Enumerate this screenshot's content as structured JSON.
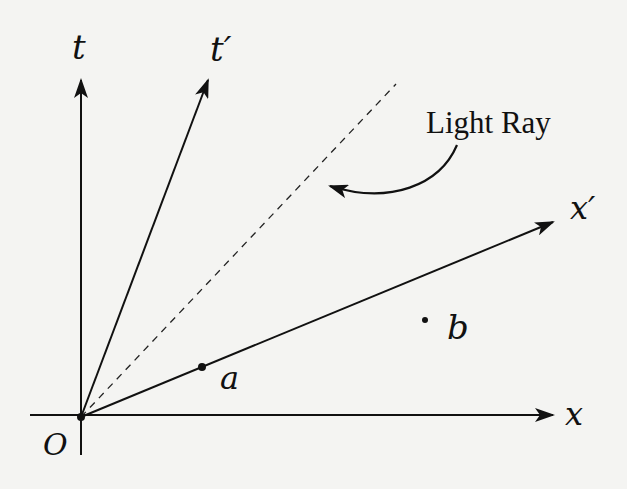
{
  "diagram": {
    "labels": {
      "t": "t",
      "t_prime": "t′",
      "x": "x",
      "x_prime": "x′",
      "origin": "O",
      "event_a": "a",
      "event_b": "b",
      "light_ray": "Light Ray"
    },
    "elements": [
      {
        "id": "t-axis",
        "type": "arrow",
        "from": [
          81,
          417
        ],
        "to": [
          81,
          78
        ]
      },
      {
        "id": "x-axis",
        "type": "arrow",
        "from": [
          30,
          415
        ],
        "to": [
          553,
          415
        ]
      },
      {
        "id": "t-prime-axis",
        "type": "arrow",
        "from": [
          81,
          417
        ],
        "to": [
          208,
          80
        ]
      },
      {
        "id": "x-prime-axis",
        "type": "arrow",
        "from": [
          81,
          417
        ],
        "to": [
          553,
          222
        ]
      },
      {
        "id": "light-ray",
        "type": "dashed-line",
        "from": [
          81,
          417
        ],
        "to": [
          396,
          84
        ]
      },
      {
        "id": "event-a",
        "type": "point",
        "at": [
          202,
          367
        ]
      },
      {
        "id": "event-b",
        "type": "point",
        "at": [
          425,
          320
        ]
      },
      {
        "id": "light-ray-pointer",
        "type": "curved-arrow",
        "from": [
          457,
          145
        ],
        "to": [
          325,
          185
        ]
      }
    ],
    "colors": {
      "ink": "#111111",
      "background": "#f4f4f2"
    }
  }
}
